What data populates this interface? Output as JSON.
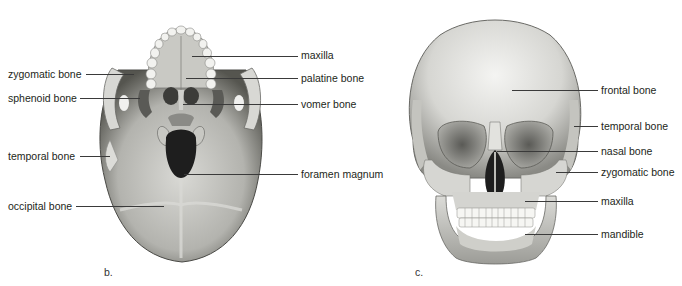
{
  "figure": {
    "panels": [
      {
        "id": "b",
        "letter": "b.",
        "view": "inferior view of skull",
        "labels_left": [
          {
            "text": "zygomatic bone"
          },
          {
            "text": "sphenoid bone"
          },
          {
            "text": "temporal bone"
          },
          {
            "text": "occipital bone"
          }
        ],
        "labels_right": [
          {
            "text": "maxilla"
          },
          {
            "text": "palatine bone"
          },
          {
            "text": "vomer bone"
          },
          {
            "text": "foramen magnum"
          }
        ]
      },
      {
        "id": "c",
        "letter": "c.",
        "view": "anterior view of skull",
        "labels_right": [
          {
            "text": "frontal bone"
          },
          {
            "text": "temporal bone"
          },
          {
            "text": "nasal bone"
          },
          {
            "text": "zygomatic bone"
          },
          {
            "text": "maxilla"
          },
          {
            "text": "mandible"
          }
        ]
      }
    ],
    "colors": {
      "bone_light": "#e6e6e2",
      "bone_mid": "#b9b9b4",
      "bone_dark": "#6e6e6a",
      "cavity": "#1e1e1e",
      "leader_line": "#3a3a3a",
      "text": "#231f20"
    }
  }
}
